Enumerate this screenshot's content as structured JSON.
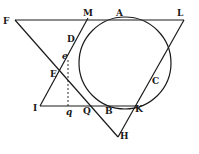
{
  "diagram": {
    "type": "geometry-figure",
    "colors": {
      "ink": "#1a1a1a",
      "background": "#ffffff"
    },
    "points": {
      "F": "F",
      "M": "M",
      "A": "A",
      "L": "L",
      "D": "D",
      "e": "e",
      "E": "E",
      "C": "C",
      "I": "I",
      "q": "q",
      "Q": "Q",
      "B": "B",
      "K": "K",
      "H": "H"
    }
  }
}
